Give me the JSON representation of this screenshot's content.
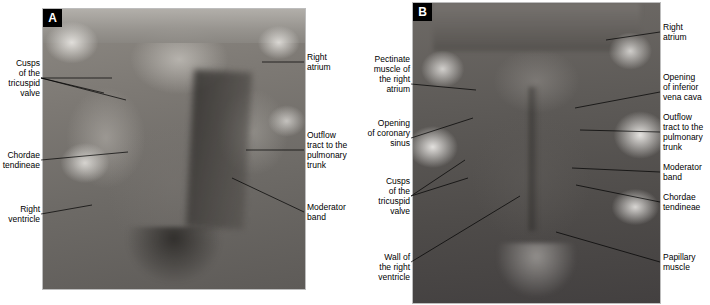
{
  "figure": {
    "panels": [
      {
        "id": "A",
        "letter": "A"
      },
      {
        "id": "B",
        "letter": "B"
      }
    ]
  },
  "labels_panel_a": [
    {
      "name": "cusps-of-the-tricuspid-valve",
      "text": "Cusps\nof the\ntricuspid\nvalve",
      "align": "right"
    },
    {
      "name": "chordae-tendineae",
      "text": "Chordae\ntendineae",
      "align": "right"
    },
    {
      "name": "right-ventricle",
      "text": "Right\nventricle",
      "align": "right"
    },
    {
      "name": "right-atrium",
      "text": "Right\natrium",
      "align": "left"
    },
    {
      "name": "outflow-tract-to-the-pulmonary-trunk",
      "text": "Outflow\ntract to the\npulmonary\ntrunk",
      "align": "left"
    },
    {
      "name": "moderator-band",
      "text": "Moderator\nband",
      "align": "left"
    }
  ],
  "labels_panel_b": [
    {
      "name": "pectinate-muscle-of-the-right-atrium",
      "text": "Pectinate\nmuscle of\nthe right\natrium",
      "align": "right"
    },
    {
      "name": "opening-of-coronary-sinus",
      "text": "Opening\nof coronary\nsinus",
      "align": "right"
    },
    {
      "name": "cusps-of-the-tricuspid-valve",
      "text": "Cusps\nof the\ntricuspid\nvalve",
      "align": "right"
    },
    {
      "name": "wall-of-the-right-ventricle",
      "text": "Wall of\nthe right\nventricle",
      "align": "right"
    },
    {
      "name": "right-atrium",
      "text": "Right\natrium",
      "align": "left"
    },
    {
      "name": "opening-of-inferior-vena-cava",
      "text": "Opening\nof inferior\nvena cava",
      "align": "left"
    },
    {
      "name": "outflow-tract-to-the-pulmonary-trunk",
      "text": "Outflow\ntract to the\npulmonary\ntrunk",
      "align": "left"
    },
    {
      "name": "moderator-band",
      "text": "Moderator\nband",
      "align": "left"
    },
    {
      "name": "chordae-tendineae",
      "text": "Chordae\ntendineae",
      "align": "left"
    },
    {
      "name": "papillary-muscle",
      "text": "Papillary\nmuscle",
      "align": "left"
    }
  ],
  "colors": {
    "label_text": "#000000",
    "leader_line": "#000000",
    "panel_letter_bg": "#000000",
    "panel_letter_fg": "#ffffff",
    "panel_border": "#bdbdbd"
  }
}
